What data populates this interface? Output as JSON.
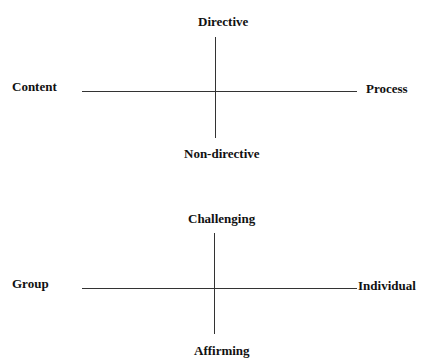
{
  "diagrams": [
    {
      "name": "content-process-directive",
      "top_label": "Directive",
      "bottom_label": "Non-directive",
      "left_label": "Content",
      "right_label": "Process"
    },
    {
      "name": "group-individual-challenging",
      "top_label": "Challenging",
      "bottom_label": "Affirming",
      "left_label": "Group",
      "right_label": "Individual"
    }
  ],
  "colors": {
    "background": "#ffffff",
    "text": "#111111",
    "line": "#333333"
  }
}
